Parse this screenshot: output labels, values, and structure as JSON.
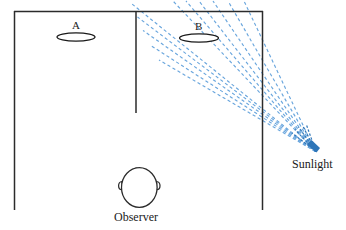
{
  "figure": {
    "type": "optics-diagram",
    "title": "",
    "background_color": "#ffffff",
    "width": 346,
    "height": 230,
    "line_color": "#2b2b2b",
    "ray_color": "#5b9bd5",
    "ray_core_color": "#2e74b5",
    "labels": {
      "surface_a": "A",
      "surface_b": "B",
      "observer": "Observer",
      "sunlight": "Sunlight"
    },
    "elements": {
      "left_wall": "vertical-line",
      "top_wall": "horizontal-line",
      "middle_wall": "vertical-line-partial",
      "right_wall": "vertical-line",
      "ellipse_a": "oval-surface",
      "ellipse_b": "oval-surface",
      "observer_head": "head-top-view",
      "sun_rays": "dashed-converging-rays",
      "sun_point": "convergence-point"
    },
    "ray_count": 11
  }
}
